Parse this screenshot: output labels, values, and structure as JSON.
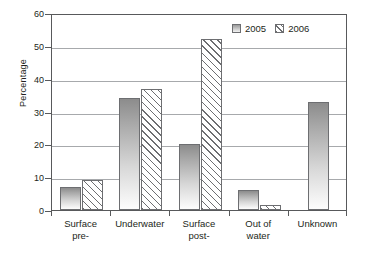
{
  "chart_data": {
    "type": "bar",
    "title": "",
    "xlabel": "",
    "ylabel": "Percentage",
    "ylim": [
      0,
      60
    ],
    "yticks": [
      0,
      10,
      20,
      30,
      40,
      50,
      60
    ],
    "grid": true,
    "legend_position": "top-right",
    "categories": [
      "Surface pre-",
      "Underwater",
      "Surface post-",
      "Out of water",
      "Unknown"
    ],
    "category_lines": [
      [
        "Surface",
        "pre-"
      ],
      [
        "Underwater",
        ""
      ],
      [
        "Surface",
        "post-"
      ],
      [
        "Out of",
        "water"
      ],
      [
        "Unknown",
        ""
      ]
    ],
    "series": [
      {
        "name": "2005",
        "values": [
          7,
          34,
          20,
          6,
          33
        ]
      },
      {
        "name": "2006",
        "values": [
          9,
          37,
          52,
          1.5,
          null
        ]
      }
    ]
  },
  "legend": {
    "entries": [
      {
        "label": "2005",
        "swatch": "solid-gray-gradient"
      },
      {
        "label": "2006",
        "swatch": "diagonal-hatch"
      }
    ]
  },
  "axis": {
    "y_title": "Percentage",
    "y_tick_labels": [
      "60",
      "50",
      "40",
      "30",
      "20",
      "10",
      "0"
    ]
  }
}
